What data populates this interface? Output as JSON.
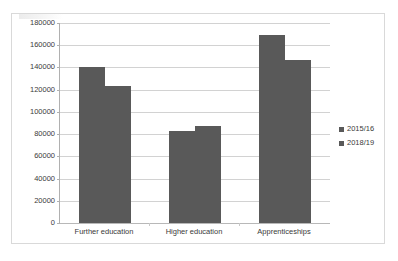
{
  "chart_data": {
    "type": "bar",
    "title": "",
    "subtitle": "",
    "xlabel": "",
    "ylabel": "",
    "categories": [
      "Further education",
      "Higher education",
      "Apprenticeships"
    ],
    "series": [
      {
        "name": "2015/16",
        "values": [
          140000,
          83000,
          169000
        ],
        "color": "#595959"
      },
      {
        "name": "2018/19",
        "values": [
          123000,
          87500,
          147000
        ],
        "color": "#595959"
      }
    ],
    "ylim": [
      0,
      180000
    ],
    "ytick_step": 20000,
    "ytick_labels": [
      "0",
      "20000",
      "40000",
      "60000",
      "80000",
      "100000",
      "120000",
      "140000",
      "160000",
      "180000"
    ],
    "grid": "horizontal",
    "legend_position": "right",
    "annotations": []
  },
  "legend": {
    "entries": [
      {
        "label": "2015/16",
        "swatch": "legend-swatch-icon"
      },
      {
        "label": "2018/19",
        "swatch": "legend-swatch-icon"
      }
    ]
  },
  "colors": {
    "bar": "#595959",
    "gridline": "#d2d2d2",
    "axis": "#b0b0b0",
    "border": "#d9d9d9",
    "text": "#3a3a3a"
  }
}
